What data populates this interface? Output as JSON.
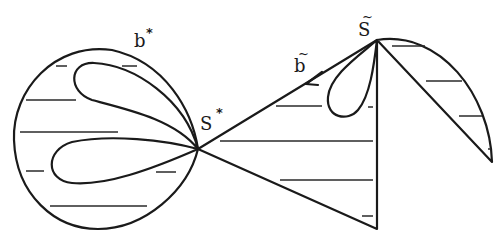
{
  "diagram": {
    "labels": {
      "b_star": {
        "text": "b",
        "marker": "*"
      },
      "s_star": {
        "text": "S",
        "marker": "*"
      },
      "b_tilde": {
        "text": "b",
        "marker": "~"
      },
      "s_tilde": {
        "text": "S",
        "marker": "~"
      }
    },
    "regions": [
      "large closed curve with two petal loops meeting at S*",
      "triangular wedge from S* to S~ down to bottom vertex",
      "small loop hanging from S~",
      "half-lens region to the right of S~"
    ],
    "colors": {
      "ink": "#1a1a1a",
      "background": "#ffffff"
    }
  }
}
